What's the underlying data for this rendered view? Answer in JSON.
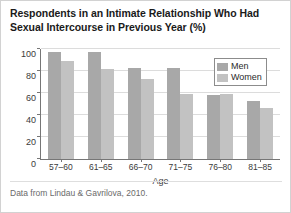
{
  "chart_data": {
    "type": "bar",
    "title": "Respondents in an Intimate Relationship Who Had Sexual Intercourse in Previous Year (%)",
    "xlabel": "Age",
    "ylabel": "",
    "ylim": [
      0,
      100
    ],
    "yticks": [
      0,
      20,
      40,
      60,
      80,
      100
    ],
    "categories": [
      "57–60",
      "61–65",
      "66–70",
      "71–75",
      "76–80",
      "81–85"
    ],
    "series": [
      {
        "name": "Men",
        "values": [
          97,
          97,
          83,
          83,
          58,
          53
        ],
        "color": "#a8a8a8"
      },
      {
        "name": "Women",
        "values": [
          89,
          82,
          73,
          59,
          59,
          46
        ],
        "color": "#c2c2c2"
      }
    ],
    "grid": true,
    "legend_position": "top-right",
    "source_note": "Data from Lindau & Gavrilova, 2010."
  }
}
